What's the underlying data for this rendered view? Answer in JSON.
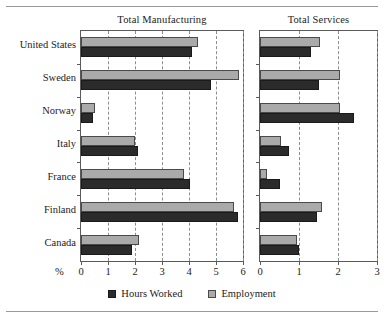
{
  "figure": {
    "axis_unit_label": "%",
    "rule_color": "#9a9a9a"
  },
  "legend": {
    "position": "bottom-center",
    "items": [
      {
        "label": "Hours Worked",
        "color": "#2b2b2b",
        "icon": "square-swatch-dark"
      },
      {
        "label": "Employment",
        "color": "#aaaaaa",
        "icon": "square-swatch-gray"
      }
    ]
  },
  "chart_data": [
    {
      "type": "bar",
      "orientation": "horizontal",
      "title": "Total Manufacturing",
      "xlabel": "%",
      "ylabel": "",
      "xlim": [
        0,
        6
      ],
      "xticks": [
        0,
        1,
        2,
        3,
        4,
        5,
        6
      ],
      "grid": true,
      "grid_style": "dashed-vertical",
      "categories": [
        "United States",
        "Sweden",
        "Norway",
        "Italy",
        "France",
        "Finland",
        "Canada"
      ],
      "series": [
        {
          "name": "Hours Worked",
          "color": "#2b2b2b",
          "values": [
            4.1,
            4.8,
            0.45,
            2.1,
            4.05,
            5.8,
            1.9
          ]
        },
        {
          "name": "Employment",
          "color": "#aaaaaa",
          "values": [
            4.35,
            5.85,
            0.5,
            2.0,
            3.8,
            5.65,
            2.15
          ]
        }
      ]
    },
    {
      "type": "bar",
      "orientation": "horizontal",
      "title": "Total Services",
      "xlabel": "%",
      "ylabel": "",
      "xlim": [
        0,
        3
      ],
      "xticks": [
        0,
        1,
        2,
        3
      ],
      "grid": true,
      "grid_style": "dashed-vertical",
      "categories": [
        "United States",
        "Sweden",
        "Norway",
        "Italy",
        "France",
        "Finland",
        "Canada"
      ],
      "series": [
        {
          "name": "Hours Worked",
          "color": "#2b2b2b",
          "values": [
            1.3,
            1.5,
            2.4,
            0.75,
            0.5,
            1.45,
            1.0
          ]
        },
        {
          "name": "Employment",
          "color": "#aaaaaa",
          "values": [
            1.55,
            2.05,
            2.05,
            0.55,
            0.18,
            1.6,
            0.95
          ]
        }
      ]
    }
  ]
}
